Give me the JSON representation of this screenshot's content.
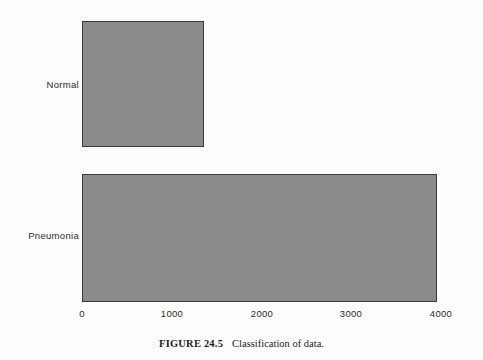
{
  "figure": {
    "caption_tag": "FIGURE 24.5",
    "caption_text": "Classification of data.",
    "bar_fill_color": "#8b8b8b",
    "bar_border_color": "#3a3a3a",
    "background_color": "#fdfdfd",
    "text_color": "#2a2a2a"
  },
  "chart_data": {
    "type": "bar",
    "orientation": "horizontal",
    "title": "",
    "xlabel": "",
    "ylabel": "",
    "categories": [
      "Normal",
      "Pneumonia"
    ],
    "values": [
      1360,
      3950
    ],
    "series": [
      {
        "name": "Number of images",
        "values": [
          1360,
          3950
        ]
      }
    ],
    "xlim": [
      0,
      4000
    ],
    "xticks": [
      0,
      1000,
      2000,
      3000,
      4000
    ],
    "xtick_labels": [
      "0",
      "1000",
      "2000",
      "3000",
      "4000"
    ],
    "grid": false,
    "legend": false,
    "legend_position": "none"
  }
}
